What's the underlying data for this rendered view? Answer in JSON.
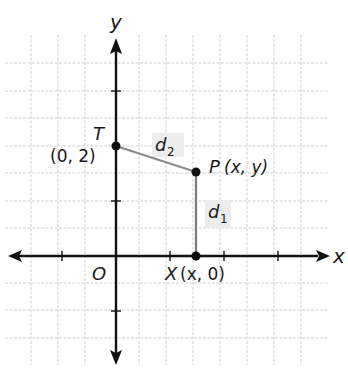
{
  "diagram": {
    "type": "coordinate-plane",
    "axes": {
      "x_label": "x",
      "y_label": "y",
      "origin_label": "O"
    },
    "grid": {
      "vertical_lines_x": [
        31,
        58,
        85,
        112,
        139,
        166,
        193,
        220,
        247,
        274,
        301
      ],
      "horizontal_lines_y": [
        63,
        91,
        118,
        146,
        173,
        201,
        228,
        256,
        283,
        310,
        338
      ],
      "color": "#c8c8c8"
    },
    "points": [
      {
        "name": "T",
        "label": "T",
        "coords_label": "(0, 2)"
      },
      {
        "name": "P",
        "label": "P",
        "coords_label": "(x, y)"
      },
      {
        "name": "X",
        "label": "X",
        "coords_label": "(x, 0)"
      }
    ],
    "segments": [
      {
        "name": "d1",
        "label_main": "d",
        "label_sub": "1",
        "from": "P",
        "to": "X"
      },
      {
        "name": "d2",
        "label_main": "d",
        "label_sub": "2",
        "from": "T",
        "to": "P"
      }
    ],
    "colors": {
      "axis": "#111111",
      "segment": "#808080",
      "label_highlight": "#ececec",
      "point": "#111111"
    }
  }
}
